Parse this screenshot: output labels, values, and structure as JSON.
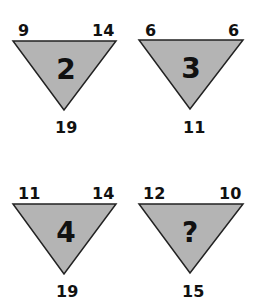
{
  "colors": {
    "triangle_fill": "#b4b4b4",
    "triangle_stroke": "#222222",
    "text": "#111111",
    "background": "#ffffff"
  },
  "triangles": [
    {
      "top_left": "9",
      "top_right": "14",
      "bottom": "19",
      "center": "2"
    },
    {
      "top_left": "6",
      "top_right": "6",
      "bottom": "11",
      "center": "3"
    },
    {
      "top_left": "11",
      "top_right": "14",
      "bottom": "19",
      "center": "4"
    },
    {
      "top_left": "12",
      "top_right": "10",
      "bottom": "15",
      "center": "?"
    }
  ]
}
